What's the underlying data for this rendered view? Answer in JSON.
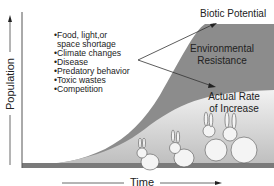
{
  "diagram": {
    "y_axis_label": "Population",
    "x_axis_label": "Time",
    "labels": {
      "biotic_potential": "Biotic Potential",
      "environmental_resistance_line1": "Environmental",
      "environmental_resistance_line2": "Resistance",
      "actual_rate_line1": "Actual Rate",
      "actual_rate_line2": "of Increase"
    },
    "factors": [
      "•Food, light,or",
      " space shortage",
      "•Climate changes",
      "•Disease",
      "•Predatory behavior",
      "•Toxic wastes",
      "•Competition"
    ],
    "colors": {
      "resistance_fill": "#8c8c8c",
      "actual_fill": "#e6e6e6",
      "base_fill": "#7a7a7a",
      "text": "#222222"
    },
    "illustration": "four rabbits of increasing size"
  }
}
